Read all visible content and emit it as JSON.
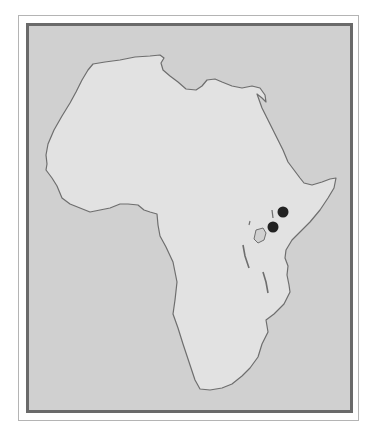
{
  "map": {
    "region": "Africa",
    "colors": {
      "frame_outer": "#b4b4b4",
      "frame_inner": "#6a6a6a",
      "ocean": "#d0d0d0",
      "land": "#e2e2e2",
      "coastline": "#6e6e6e",
      "marker": "#222222"
    },
    "markers": [
      {
        "name": "site-1",
        "cx": 283,
        "cy": 212,
        "r": 5.5
      },
      {
        "name": "site-2",
        "cx": 273,
        "cy": 227,
        "r": 5.5
      }
    ]
  }
}
